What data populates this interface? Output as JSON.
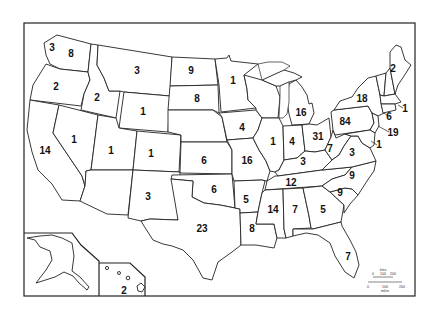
{
  "map": {
    "type": "choropleth-count-labels",
    "region": "United States",
    "background": "#ffffff",
    "line_color": "#222222",
    "scale_bar": {
      "top_unit": "kms",
      "top_ticks": [
        "0",
        "100",
        "200"
      ],
      "bottom_unit": "miles",
      "bottom_ticks": [
        "0",
        "100",
        "200"
      ]
    },
    "states": [
      {
        "id": "WA-islands",
        "value": "3",
        "x": 52,
        "y": 48
      },
      {
        "id": "WA",
        "value": "8",
        "x": 71,
        "y": 54
      },
      {
        "id": "OR",
        "value": "2",
        "x": 56,
        "y": 87
      },
      {
        "id": "ID",
        "value": "2",
        "x": 97,
        "y": 98
      },
      {
        "id": "MT",
        "value": "3",
        "x": 137,
        "y": 71
      },
      {
        "id": "WY",
        "value": "1",
        "x": 143,
        "y": 112
      },
      {
        "id": "ND",
        "value": "9",
        "x": 191,
        "y": 71
      },
      {
        "id": "SD",
        "value": "8",
        "x": 197,
        "y": 99
      },
      {
        "id": "MN",
        "value": "1",
        "x": 233,
        "y": 81
      },
      {
        "id": "NV",
        "value": "1",
        "x": 74,
        "y": 140
      },
      {
        "id": "CA",
        "value": "14",
        "x": 45,
        "y": 151
      },
      {
        "id": "UT",
        "value": "1",
        "x": 111,
        "y": 151
      },
      {
        "id": "CO",
        "value": "1",
        "x": 151,
        "y": 154
      },
      {
        "id": "NE",
        "value": "",
        "x": 205,
        "y": 125
      },
      {
        "id": "KS",
        "value": "6",
        "x": 204,
        "y": 161
      },
      {
        "id": "IA",
        "value": "4",
        "x": 242,
        "y": 128
      },
      {
        "id": "MO",
        "value": "16",
        "x": 247,
        "y": 161
      },
      {
        "id": "IL",
        "value": "1",
        "x": 273,
        "y": 142
      },
      {
        "id": "WI",
        "value": "",
        "x": 268,
        "y": 102
      },
      {
        "id": "MI",
        "value": "16",
        "x": 301,
        "y": 113
      },
      {
        "id": "IN",
        "value": "4",
        "x": 292,
        "y": 142
      },
      {
        "id": "OH",
        "value": "31",
        "x": 318,
        "y": 137
      },
      {
        "id": "KY",
        "value": "3",
        "x": 303,
        "y": 162
      },
      {
        "id": "WV",
        "value": "7",
        "x": 330,
        "y": 149
      },
      {
        "id": "VA",
        "value": "3",
        "x": 352,
        "y": 153
      },
      {
        "id": "PA",
        "value": "84",
        "x": 345,
        "y": 122
      },
      {
        "id": "NY",
        "value": "18",
        "x": 362,
        "y": 99
      },
      {
        "id": "ME",
        "value": "2",
        "x": 393,
        "y": 69
      },
      {
        "id": "MA-RI",
        "value": "1",
        "x": 405,
        "y": 109
      },
      {
        "id": "CT",
        "value": "6",
        "x": 389,
        "y": 117
      },
      {
        "id": "NJ",
        "value": "19",
        "x": 393,
        "y": 133
      },
      {
        "id": "MD-DE",
        "value": "1",
        "x": 379,
        "y": 145
      },
      {
        "id": "AZ",
        "value": "3",
        "x": 148,
        "y": 197
      },
      {
        "id": "NM",
        "value": "",
        "x": 167,
        "y": 196
      },
      {
        "id": "OK",
        "value": "6",
        "x": 214,
        "y": 190
      },
      {
        "id": "TX",
        "value": "23",
        "x": 202,
        "y": 229
      },
      {
        "id": "AR",
        "value": "5",
        "x": 246,
        "y": 200
      },
      {
        "id": "LA",
        "value": "8",
        "x": 252,
        "y": 229
      },
      {
        "id": "TN",
        "value": "12",
        "x": 291,
        "y": 183
      },
      {
        "id": "NC",
        "value": "9",
        "x": 352,
        "y": 176
      },
      {
        "id": "SC",
        "value": "9",
        "x": 340,
        "y": 193
      },
      {
        "id": "MS",
        "value": "14",
        "x": 273,
        "y": 210
      },
      {
        "id": "AL",
        "value": "7",
        "x": 295,
        "y": 210
      },
      {
        "id": "GA",
        "value": "5",
        "x": 323,
        "y": 210
      },
      {
        "id": "FL",
        "value": "7",
        "x": 348,
        "y": 257
      },
      {
        "id": "HI",
        "value": "2",
        "x": 124,
        "y": 291
      }
    ]
  }
}
